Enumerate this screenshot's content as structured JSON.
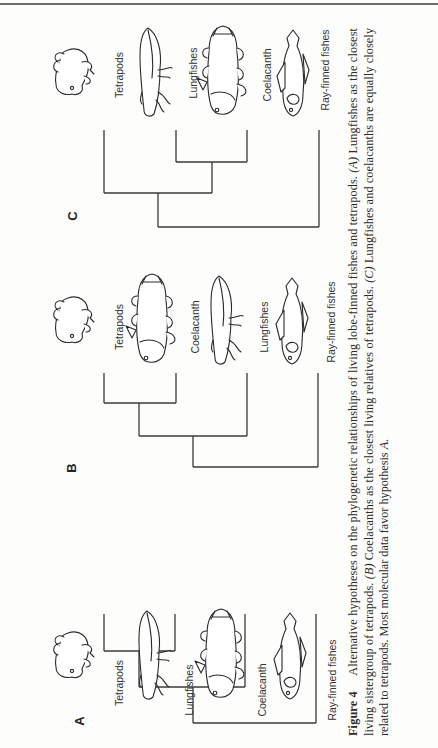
{
  "figure": {
    "number_label": "Figure 4",
    "caption_lines": [
      [
        "Alternative hypotheses on the phylogenetic relationships of living lobe-finned fishes and tetrapods. ",
        "(A)",
        " Lungfishes as the closest"
      ],
      [
        "living sistergroup of tetrapods. ",
        "(B)",
        " Coelacanths as the closest living relatives of tetrapods. ",
        "(C)",
        " Lungfishes and coelacanths are equally closely"
      ],
      [
        "related to tetrapods. Most molecular data favor hypothesis ",
        "A",
        "."
      ]
    ],
    "caption_full": "Figure 4 Alternative hypotheses on the phylogenetic relationships of living lobe-finned fishes and tetrapods. (A) Lungfishes as the closest living sistergroup of tetrapods. (B) Coelacanths as the closest living relatives of tetrapods. (C) Lungfishes and coelacanths are equally closely related to tetrapods. Most molecular data favor hypothesis A."
  },
  "panels": [
    {
      "letter": "A",
      "letter_pos": [
        84,
        721
      ],
      "taxa": [
        {
          "label": "Tetrapods",
          "animal": "tetrapod",
          "label_x": 123,
          "label_y": 683
        },
        {
          "label": "Lungfishes",
          "animal": "lungfish",
          "label_x": 193,
          "label_y": 690
        },
        {
          "label": "Coelacanth",
          "animal": "coelacanth",
          "label_x": 266,
          "label_y": 690
        },
        {
          "label": "Ray-finned fishes",
          "animal": "rayfinned",
          "label_x": 336,
          "label_y": 680
        }
      ],
      "tips_x": [
        104,
        175,
        245,
        316
      ],
      "tip_top": 614,
      "nodes": [
        {
          "y": 651,
          "x1": 104,
          "x2": 175
        },
        {
          "y": 687,
          "x1": 139,
          "x2": 245,
          "stem_x": 139,
          "stem_from": 651
        },
        {
          "y": 723,
          "x1": 193,
          "x2": 316,
          "stem_x": 193,
          "stem_from": 687
        }
      ],
      "animal_y": 655
    },
    {
      "letter": "B",
      "letter_pos": [
        76,
        468
      ],
      "taxa": [
        {
          "label": "Tetrapods",
          "animal": "tetrapod",
          "label_x": 123,
          "label_y": 327
        },
        {
          "label": "Coelacanth",
          "animal": "coelacanth",
          "label_x": 199,
          "label_y": 327
        },
        {
          "label": "Lungfishes",
          "animal": "lungfish",
          "label_x": 268,
          "label_y": 327
        },
        {
          "label": "Ray-finned fishes",
          "animal": "rayfinned",
          "label_x": 335,
          "label_y": 322
        }
      ],
      "tips_x": [
        104,
        176,
        247,
        318
      ],
      "tip_top": 373,
      "nodes": [
        {
          "y": 403,
          "x1": 104,
          "x2": 176
        },
        {
          "y": 436,
          "x1": 139,
          "x2": 247,
          "stem_x": 139,
          "stem_from": 403
        },
        {
          "y": 467,
          "x1": 193,
          "x2": 318,
          "stem_x": 193,
          "stem_from": 436
        }
      ],
      "animal_y": 320
    },
    {
      "letter": "C",
      "letter_pos": [
        77,
        216
      ],
      "taxa": [
        {
          "label": "Tetrapods",
          "animal": "tetrapod",
          "label_x": 123,
          "label_y": 75
        },
        {
          "label": "Lungfishes",
          "animal": "lungfish",
          "label_x": 197,
          "label_y": 73
        },
        {
          "label": "Coelacanth",
          "animal": "coelacanth",
          "label_x": 271,
          "label_y": 75
        },
        {
          "label": "Ray-finned fishes",
          "animal": "rayfinned",
          "label_x": 329,
          "label_y": 70
        }
      ],
      "tips_x": [
        104,
        176,
        247,
        319
      ],
      "tip_top": 130,
      "nodes": [
        {
          "y": 162,
          "x1": 176,
          "x2": 247
        },
        {
          "y": 193,
          "x1": 104,
          "x2": 212,
          "stem_x": 212,
          "stem_from": 162
        },
        {
          "y": 227,
          "x1": 158,
          "x2": 319,
          "stem_x": 158,
          "stem_from": 193
        }
      ],
      "animal_y": 72
    }
  ],
  "caption_layout": {
    "line_x": [
      357,
      373,
      388
    ],
    "start_y": 736
  },
  "colors": {
    "ink": "#2a2a2a",
    "paper": "#fdfdfb",
    "rule": "#6e6e6e"
  }
}
